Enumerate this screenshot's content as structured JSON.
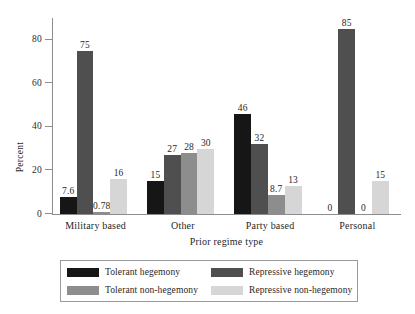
{
  "chart_data": {
    "type": "bar",
    "title": "",
    "xlabel": "Prior regime type",
    "ylabel": "Percent",
    "ylim": [
      0,
      90
    ],
    "yticks": [
      0,
      20,
      40,
      60,
      80
    ],
    "grid": false,
    "legend_position": "bottom",
    "categories": [
      "Military based",
      "Other",
      "Party based",
      "Personal"
    ],
    "series": [
      {
        "name": "Tolerant hegemony",
        "color": "#161616",
        "values": [
          7.6,
          15,
          46,
          0
        ],
        "labels": [
          "7.6",
          "15",
          "46",
          "0"
        ]
      },
      {
        "name": "Repressive hegemony",
        "color": "#4f4f4f",
        "values": [
          75,
          27,
          32,
          85
        ],
        "labels": [
          "75",
          "27",
          "32",
          "85"
        ]
      },
      {
        "name": "Tolerant non-hegemony",
        "color": "#8d8d8d",
        "values": [
          0.78,
          28,
          8.7,
          0
        ],
        "labels": [
          "0.78",
          "28",
          "8.7",
          "0"
        ]
      },
      {
        "name": "Repressive non-hegemony",
        "color": "#d6d6d6",
        "values": [
          16,
          30,
          13,
          15
        ],
        "labels": [
          "16",
          "30",
          "13",
          "15"
        ]
      }
    ]
  }
}
